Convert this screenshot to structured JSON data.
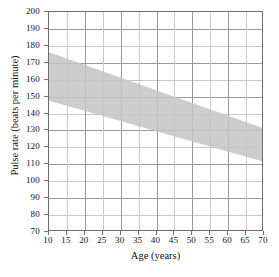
{
  "chart_data": {
    "type": "area",
    "title": "",
    "xlabel": "Age (years)",
    "ylabel": "Pulse rate (beats per minute)",
    "xlim": [
      10,
      70
    ],
    "ylim": [
      70,
      200
    ],
    "xticks": [
      10,
      15,
      20,
      25,
      30,
      35,
      40,
      45,
      50,
      55,
      60,
      65,
      70
    ],
    "yticks": [
      70,
      80,
      90,
      100,
      110,
      120,
      130,
      140,
      150,
      160,
      170,
      180,
      190,
      200
    ],
    "xtick_labels": [
      "10",
      "15",
      "20",
      "25",
      "30",
      "35",
      "40",
      "45",
      "50",
      "55",
      "60",
      "65",
      "70"
    ],
    "ytick_labels": [
      "70",
      "80",
      "90",
      "100",
      "110",
      "120",
      "130",
      "140",
      "150",
      "160",
      "170",
      "180",
      "190",
      "200"
    ],
    "grid": true,
    "x_major_every": 2,
    "y_major_every": 2,
    "legend": "none",
    "band_color": "#c4c4c4",
    "band_opacity": 0.85,
    "series": [
      {
        "name": "Upper limit of target pulse rate zone",
        "x": [
          10,
          70
        ],
        "values": [
          176,
          131
        ]
      },
      {
        "name": "Lower limit of target pulse rate zone",
        "x": [
          10,
          70
        ],
        "values": [
          147,
          111
        ]
      }
    ],
    "band": {
      "x": [
        10,
        70
      ],
      "upper": [
        176,
        131
      ],
      "lower": [
        147,
        111
      ]
    },
    "annotations": []
  },
  "axes": {
    "y_title": "Pulse rate (beats per minute)",
    "x_title": "Age (years)"
  },
  "colors": {
    "band": "#c4c4c4",
    "frame": "#6d6d6d",
    "grid_minor": "#c9c9c9",
    "grid_major": "#9a9a9a",
    "text": "#111111",
    "background": "#ffffff"
  }
}
